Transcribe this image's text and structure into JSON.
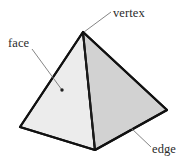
{
  "figure": {
    "background_color": "#ffffff",
    "solid": {
      "name": "square pyramid",
      "apex": [
        83,
        32
      ],
      "front_base_corner": [
        95,
        150
      ],
      "left_base_corner": [
        20,
        127
      ],
      "right_base_corner": [
        167,
        110
      ],
      "left_face_color": "#ececec",
      "right_face_color": "#d2d2d2",
      "outline_color": "#111111",
      "outline_width": 2.1,
      "front_edge_color": "#1a1a1a",
      "front_edge_width": 1.9
    },
    "labels": [
      {
        "id": "vertex",
        "text": "vertex",
        "text_x": 113,
        "text_y": 17,
        "leader_from": [
          111,
          12
        ],
        "leader_to": [
          84,
          32
        ],
        "has_dot": false
      },
      {
        "id": "face",
        "text": "face",
        "text_x": 8,
        "text_y": 47,
        "leader_from": [
          32,
          49
        ],
        "leader_to": [
          62,
          90
        ],
        "has_dot": true,
        "dot_x": 62,
        "dot_y": 90
      },
      {
        "id": "edge",
        "text": "edge",
        "text_x": 152,
        "text_y": 153,
        "leader_from": [
          131,
          128
        ],
        "leader_to": [
          151,
          147
        ],
        "has_dot": false
      }
    ],
    "leader_color": "#777777",
    "leader_width": 0.9,
    "dot_color": "#222222"
  }
}
